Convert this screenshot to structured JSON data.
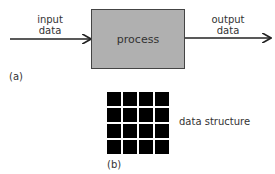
{
  "diagram": {
    "part_a": {
      "input_label": [
        "input",
        "data"
      ],
      "process_label": "process",
      "output_label": [
        "output",
        "data"
      ],
      "caption": "(a)"
    },
    "part_b": {
      "grid_rows": 4,
      "grid_cols": 4,
      "structure_label": "data structure",
      "caption": "(b)"
    },
    "colors": {
      "process_fill": "#b0b0b0",
      "grid_fill": "#000000",
      "line": "#222222"
    }
  }
}
